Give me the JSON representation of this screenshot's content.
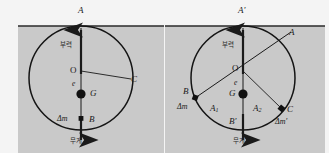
{
  "figure": {
    "title_alt": "Ship stability buoyancy diagram",
    "water_fill": "#c9c9c9",
    "sky_fill": "#f4f4f4",
    "line_color": "#1a1a1a",
    "marker_color": "#111111"
  },
  "left": {
    "name": "upright-condition",
    "labels": {
      "top_point": "A",
      "center": "O",
      "eccentricity": "e",
      "gravity_center": "G",
      "side_point": "C",
      "bottom_point": "B",
      "delta_m": "Δm",
      "buoyancy_ko": "부력",
      "weight_ko": "무게"
    }
  },
  "right": {
    "name": "heeled-condition",
    "labels": {
      "top_point_prime": "A'",
      "top_point_tilted": "A",
      "center": "O",
      "eccentricity": "e",
      "gravity_center": "G",
      "left_point": "B",
      "right_point": "C",
      "bottom_point_prime": "B'",
      "arc_left": "A",
      "arc_left_sub": "1",
      "arc_right": "A",
      "arc_right_sub": "2",
      "delta_m": "Δm",
      "delta_m_prime": "Δm'",
      "buoyancy_ko": "부력",
      "weight_ko": "무게"
    }
  }
}
